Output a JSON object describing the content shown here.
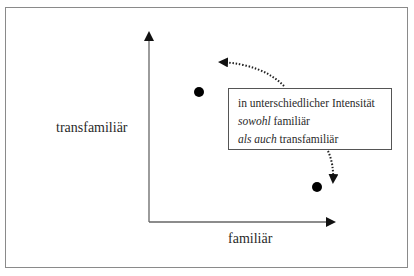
{
  "diagram": {
    "axes": {
      "y_label": "transfamiliär",
      "x_label": "familiär"
    },
    "points": [
      {
        "name": "point-upper-left",
        "cx": 199,
        "cy": 92
      },
      {
        "name": "point-lower-right",
        "cx": 317,
        "cy": 187
      }
    ],
    "textbox": {
      "line1": "in unterschiedlicher Intensität",
      "line2_italic": "sowohl",
      "line2_rest": " familiär",
      "line3_italic": "als auch",
      "line3_rest": " transfamiliär"
    },
    "colors": {
      "frame": "#8a8a8a",
      "axis": "#555555",
      "point": "#000000"
    }
  }
}
